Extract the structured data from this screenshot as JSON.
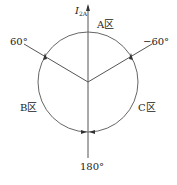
{
  "diagram": {
    "axis_label": "I",
    "axis_label_sub": "2A",
    "region_a": "A区",
    "region_b": "B区",
    "region_c": "C区",
    "angle_left": "60°",
    "angle_right": "−60°",
    "angle_bottom": "180°",
    "colors": {
      "line": "#555555",
      "text": "#222222"
    }
  }
}
